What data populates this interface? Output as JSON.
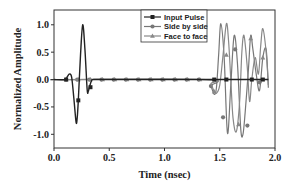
{
  "chart_data": {
    "type": "line",
    "title": "",
    "xlabel": "Time (nsec)",
    "ylabel": "Normalized Amplitude",
    "xlim": [
      0.0,
      2.0
    ],
    "ylim": [
      -1.25,
      1.27
    ],
    "x_ticks": [
      0.0,
      0.5,
      1.0,
      1.5,
      2.0
    ],
    "x_tick_labels": [
      "0.0",
      "0.5",
      "1.0",
      "1.5",
      "2.0"
    ],
    "y_ticks": [
      1.0,
      0.5,
      0.0,
      -0.5,
      -1.0
    ],
    "y_tick_labels": [
      "1.0",
      "0.5",
      "0.0",
      "-0.5",
      "-1.0"
    ],
    "grid": false,
    "legend_position": "top-right",
    "series": [
      {
        "name": "Input Pulse",
        "color": "#222222",
        "marker": "square",
        "x": [
          0.0,
          0.1,
          0.12,
          0.14,
          0.16,
          0.18,
          0.2,
          0.21,
          0.22,
          0.24,
          0.26,
          0.28,
          0.3,
          0.31,
          0.32,
          0.34,
          0.36,
          0.5,
          1.0,
          1.45,
          1.56,
          1.79,
          1.89,
          1.94
        ],
        "y": [
          0.0,
          0.0,
          0.05,
          0.1,
          0.04,
          -0.35,
          -0.78,
          -0.7,
          -0.38,
          0.45,
          1.0,
          0.55,
          -0.18,
          -0.22,
          -0.14,
          -0.02,
          0.0,
          0.0,
          0.0,
          0.0,
          0.0,
          0.0,
          0.0,
          0.0
        ],
        "marker_x": [
          0.11,
          0.22,
          0.33,
          1.45,
          1.56,
          1.79,
          1.89
        ],
        "marker_y": [
          0.0,
          -0.38,
          -0.14,
          0.0,
          0.0,
          0.0,
          0.0
        ]
      },
      {
        "name": "Side by side",
        "color": "#777777",
        "marker": "circle",
        "x": [
          0.0,
          0.1,
          1.38,
          1.42,
          1.45,
          1.47,
          1.49,
          1.51,
          1.54,
          1.57,
          1.6,
          1.63,
          1.66,
          1.69,
          1.71,
          1.73,
          1.76,
          1.78,
          1.8,
          1.83,
          1.86,
          1.89,
          1.92,
          1.94
        ],
        "y": [
          0.0,
          0.0,
          0.0,
          -0.12,
          -0.27,
          -0.15,
          0.45,
          1.02,
          0.4,
          -0.98,
          -0.1,
          0.8,
          0.3,
          -0.9,
          -1.0,
          -0.6,
          0.2,
          0.8,
          0.55,
          0.1,
          -0.2,
          0.4,
          0.55,
          -0.15
        ],
        "marker_x": [
          0.11,
          0.21,
          0.32,
          0.43,
          0.54,
          0.65,
          0.76,
          0.87,
          0.98,
          1.09,
          1.2,
          1.31,
          1.42,
          1.53,
          1.64,
          1.75,
          1.86
        ],
        "marker_y": [
          0.0,
          0.0,
          0.0,
          0.0,
          0.0,
          0.0,
          0.0,
          0.0,
          0.0,
          0.0,
          0.0,
          0.0,
          -0.12,
          -0.69,
          0.55,
          -0.84,
          -0.05
        ]
      },
      {
        "name": "Face to face",
        "color": "#888888",
        "marker": "triangle",
        "x": [
          0.0,
          0.1,
          1.38,
          1.42,
          1.45,
          1.47,
          1.5,
          1.53,
          1.56,
          1.58,
          1.6,
          1.62,
          1.65,
          1.68,
          1.7,
          1.72,
          1.75,
          1.77,
          1.79,
          1.82,
          1.85,
          1.87,
          1.89,
          1.92,
          1.94
        ],
        "y": [
          0.0,
          0.0,
          0.0,
          -0.08,
          -0.22,
          -0.25,
          -0.1,
          0.45,
          1.02,
          0.7,
          0.0,
          -0.7,
          -0.95,
          -0.4,
          0.5,
          0.8,
          0.2,
          -0.4,
          0.0,
          0.4,
          0.1,
          0.6,
          0.93,
          0.5,
          -0.1
        ],
        "marker_x": [
          0.11,
          0.22,
          0.33,
          0.44,
          0.55,
          0.66,
          0.77,
          0.88,
          0.99,
          1.1,
          1.21,
          1.32,
          1.45,
          1.56,
          1.67,
          1.78,
          1.89
        ],
        "marker_y": [
          0.0,
          0.0,
          0.0,
          0.0,
          0.0,
          0.0,
          0.0,
          0.0,
          0.0,
          0.0,
          0.0,
          0.0,
          -0.22,
          0.45,
          -0.82,
          0.75,
          0.4
        ]
      }
    ]
  }
}
